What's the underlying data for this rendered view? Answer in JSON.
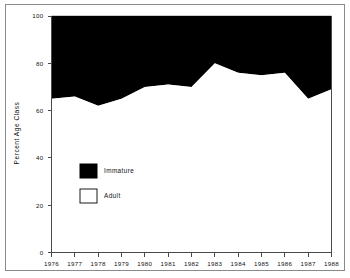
{
  "figure": {
    "name": "percent-age-class-area-chart"
  },
  "axes": {
    "y_title": "Percent Age Class",
    "x_ticks": [
      "1976",
      "1977",
      "1978",
      "1979",
      "1980",
      "1981",
      "1982",
      "1983",
      "1984",
      "1985",
      "1986",
      "1987",
      "1988"
    ],
    "y_ticks": [
      "0",
      "20",
      "40",
      "60",
      "80",
      "100"
    ]
  },
  "legend": {
    "items": [
      {
        "label": "Immature",
        "color": "#000000",
        "swatch": "filled-black-square"
      },
      {
        "label": "Adult",
        "color": "#ffffff",
        "swatch": "open-white-square"
      }
    ]
  },
  "chart_data": {
    "type": "area",
    "title": "",
    "xlabel": "",
    "ylabel": "Percent Age Class",
    "categories": [
      "1976",
      "1977",
      "1978",
      "1979",
      "1980",
      "1981",
      "1982",
      "1983",
      "1984",
      "1985",
      "1986",
      "1987",
      "1988"
    ],
    "x": [
      1976,
      1977,
      1978,
      1979,
      1980,
      1981,
      1982,
      1983,
      1984,
      1985,
      1986,
      1987,
      1988
    ],
    "xlim": [
      1976,
      1988
    ],
    "ylim": [
      0,
      100
    ],
    "stacked": true,
    "grid": false,
    "legend_position": "inside-lower-left",
    "series": [
      {
        "name": "Adult",
        "color": "#ffffff",
        "values": [
          65,
          66,
          62,
          65,
          70,
          71,
          70,
          80,
          76,
          75,
          76,
          65,
          69
        ]
      },
      {
        "name": "Immature",
        "color": "#000000",
        "values": [
          35,
          34,
          38,
          35,
          30,
          29,
          30,
          20,
          24,
          25,
          24,
          35,
          31
        ]
      }
    ],
    "boundary_note": "Black region above the curve is Immature; white region below the curve is Adult."
  }
}
